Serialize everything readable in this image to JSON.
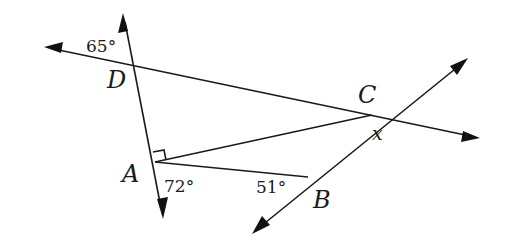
{
  "diagram": {
    "points": {
      "D": {
        "label": "D",
        "x": 133,
        "y": 63
      },
      "A": {
        "label": "A",
        "x": 155,
        "y": 162
      },
      "B": {
        "label": "B",
        "x": 308,
        "y": 177
      },
      "C": {
        "label": "C",
        "x": 372,
        "y": 115
      }
    },
    "angles": {
      "at_D": "65°",
      "at_A": "72°",
      "at_B": "51°",
      "at_C": "x"
    },
    "right_angle_marker": "A",
    "lines": [
      {
        "name": "line-DA",
        "description": "line through D and A",
        "arrows": [
          "up",
          "down"
        ]
      },
      {
        "name": "line-DC",
        "description": "line through D and C",
        "arrows": [
          "left",
          "right"
        ]
      },
      {
        "name": "line-BC",
        "description": "line through B and C",
        "arrows": [
          "up-right",
          "down-left"
        ]
      }
    ],
    "segments": [
      "AC",
      "AB"
    ]
  }
}
